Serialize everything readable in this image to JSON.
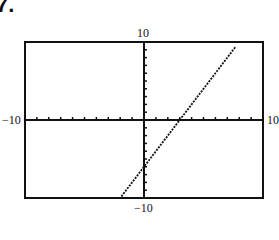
{
  "problem": {
    "number": "7."
  },
  "chart_data": {
    "type": "line",
    "title": "",
    "xlabel": "",
    "ylabel": "",
    "xlim": [
      -10,
      10
    ],
    "ylim": [
      -10,
      10
    ],
    "x_tick_labels": {
      "min": "−10",
      "max": "10"
    },
    "y_tick_labels": {
      "min": "−10",
      "max": "10"
    },
    "tick_spacing": 1,
    "grid": false,
    "legend": null,
    "series": [
      {
        "name": "y = 2x − 6",
        "equation": {
          "slope": 2,
          "intercept": -6
        },
        "x": [
          -1.9,
          7.7
        ],
        "y": [
          -9.8,
          9.4
        ],
        "style": "dotted-pixel"
      }
    ],
    "x_intercept": 3,
    "y_intercept": -6
  },
  "layout": {
    "box": {
      "left": 25,
      "top": 42,
      "right": 263,
      "bottom": 198
    },
    "colors": {
      "axis": "#111111",
      "frame": "#111111",
      "line": "#111111",
      "background": "#ffffff"
    }
  }
}
